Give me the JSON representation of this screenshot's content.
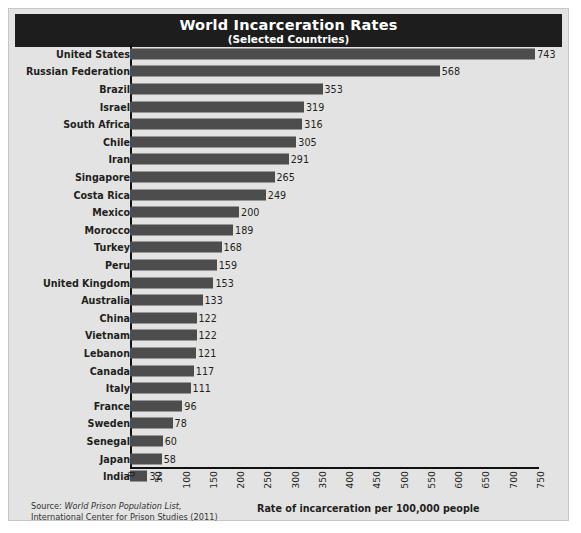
{
  "chart_data": {
    "type": "bar",
    "orientation": "horizontal",
    "title": "World Incarceration Rates",
    "subtitle": "(Selected Countries)",
    "xlabel": "Rate of incarceration per 100,000 people",
    "ylabel": "",
    "xlim": [
      0,
      750
    ],
    "xticks": [
      0,
      50,
      100,
      150,
      200,
      250,
      300,
      350,
      400,
      450,
      500,
      550,
      600,
      650,
      700,
      750
    ],
    "grid": false,
    "legend": null,
    "bar_color": "#4d4d4d",
    "title_bar_color": "#1d1d1d",
    "background_color": "#e3e3e3",
    "categories": [
      "United States",
      "Russian Federation",
      "Brazil",
      "Israel",
      "South Africa",
      "Chile",
      "Iran",
      "Singapore",
      "Costa Rica",
      "Mexico",
      "Morocco",
      "Turkey",
      "Peru",
      "United Kingdom",
      "Australia",
      "China",
      "Vietnam",
      "Lebanon",
      "Canada",
      "Italy",
      "France",
      "Sweden",
      "Senegal",
      "Japan",
      "India"
    ],
    "values": [
      743,
      568,
      353,
      319,
      316,
      305,
      291,
      265,
      249,
      200,
      189,
      168,
      159,
      153,
      133,
      122,
      122,
      121,
      117,
      111,
      96,
      78,
      60,
      58,
      32
    ]
  },
  "footer": {
    "source_prefix": "Source:",
    "source_title": "World Prison Population List,",
    "source_org": "International Center for Prison Studies (2011)"
  }
}
